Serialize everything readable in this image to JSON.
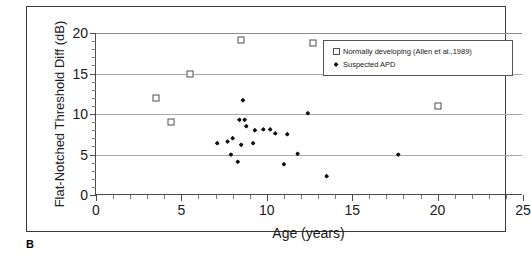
{
  "figure": {
    "caption": "B"
  },
  "legend": {
    "items": [
      {
        "label": "Normally developing (Allen et al.,1989)",
        "marker": "open-square-icon"
      },
      {
        "label": "Suspected APD",
        "marker": "filled-diamond-icon"
      }
    ]
  },
  "chart_data": {
    "type": "scatter",
    "title": "",
    "xlabel": "Age (years)",
    "ylabel": "Flat-Notched Threshold Diff (dB)",
    "xlim": [
      0,
      25
    ],
    "ylim": [
      0,
      20
    ],
    "xticks": [
      0,
      5,
      10,
      15,
      20,
      25
    ],
    "yticks": [
      0,
      5,
      10,
      15,
      20
    ],
    "xtick_labels": [
      "0",
      "5",
      "10",
      "15",
      "20",
      "25"
    ],
    "ytick_labels": [
      "0",
      "5",
      "10",
      "15",
      "20"
    ],
    "grid": "horizontal-major",
    "legend_position": "top-right-inside",
    "series": [
      {
        "name": "Normally developing (Allen et al.,1989)",
        "marker": "open-square",
        "color": "#4f4f4f",
        "points": [
          {
            "x": 3.5,
            "y": 12.0
          },
          {
            "x": 4.4,
            "y": 9.0
          },
          {
            "x": 5.5,
            "y": 15.0
          },
          {
            "x": 8.5,
            "y": 19.1
          },
          {
            "x": 12.7,
            "y": 18.8
          },
          {
            "x": 20.0,
            "y": 11.0
          }
        ]
      },
      {
        "name": "Suspected APD",
        "marker": "filled-diamond",
        "color": "#111111",
        "points": [
          {
            "x": 8.6,
            "y": 11.7
          },
          {
            "x": 8.4,
            "y": 9.3
          },
          {
            "x": 8.7,
            "y": 9.3
          },
          {
            "x": 8.8,
            "y": 8.5
          },
          {
            "x": 9.3,
            "y": 8.0
          },
          {
            "x": 9.8,
            "y": 8.1
          },
          {
            "x": 10.2,
            "y": 8.1
          },
          {
            "x": 10.5,
            "y": 7.6
          },
          {
            "x": 11.2,
            "y": 7.5
          },
          {
            "x": 12.4,
            "y": 10.1
          },
          {
            "x": 7.1,
            "y": 6.4
          },
          {
            "x": 7.7,
            "y": 6.6
          },
          {
            "x": 8.0,
            "y": 7.0
          },
          {
            "x": 8.5,
            "y": 6.2
          },
          {
            "x": 9.2,
            "y": 6.4
          },
          {
            "x": 7.9,
            "y": 5.0
          },
          {
            "x": 8.3,
            "y": 4.1
          },
          {
            "x": 11.0,
            "y": 3.8
          },
          {
            "x": 11.8,
            "y": 5.1
          },
          {
            "x": 13.5,
            "y": 2.3
          },
          {
            "x": 17.7,
            "y": 5.0
          }
        ]
      }
    ]
  }
}
